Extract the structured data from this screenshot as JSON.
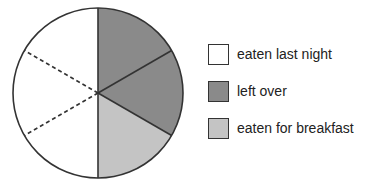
{
  "chart_data": {
    "type": "pie",
    "title": "",
    "total_slices": 6,
    "slices": [
      {
        "label": "left over",
        "category": "left-over",
        "value": 1
      },
      {
        "label": "left over",
        "category": "left-over",
        "value": 1
      },
      {
        "label": "eaten for breakfast",
        "category": "eaten-for-breakfast",
        "value": 1
      },
      {
        "label": "eaten last night",
        "category": "eaten-last-night",
        "value": 1
      },
      {
        "label": "eaten last night",
        "category": "eaten-last-night",
        "value": 1
      },
      {
        "label": "eaten last night",
        "category": "eaten-last-night",
        "value": 1
      }
    ],
    "legend": [
      {
        "label": "eaten last night",
        "color": "#ffffff"
      },
      {
        "label": "left over",
        "color": "#8a8a8a"
      },
      {
        "label": "eaten for breakfast",
        "color": "#c4c4c4"
      }
    ],
    "legend_position": "right"
  }
}
